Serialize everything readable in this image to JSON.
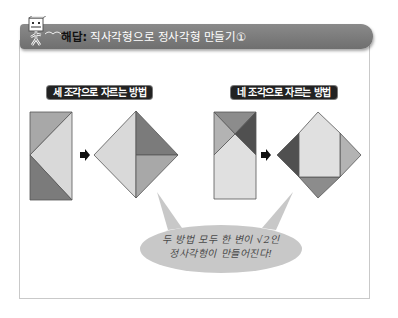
{
  "header": {
    "lead": "해답:",
    "title": " 직사각형으로 정사각형 만들기①",
    "mascot_icon": "cube-mascot-icon"
  },
  "methods": [
    {
      "label": "세 조각으로 자르는 방법",
      "pieces": 3,
      "colors": {
        "medium": "#a8a8a8",
        "light": "#d9d9d9",
        "dark": "#7b7b7b"
      }
    },
    {
      "label": "네 조각으로 자르는 방법",
      "pieces": 4,
      "colors": {
        "top": "#8c8c8c",
        "left": "#b3b3b3",
        "right": "#505050",
        "light": "#e0e0e0"
      }
    }
  ],
  "arrow_icon": "right-arrow-icon",
  "bubble": {
    "line1": "두 방법 모두 한 변이 √2인",
    "line2": "정사각형이 만들어진다!",
    "color": "#c8c8c8"
  }
}
